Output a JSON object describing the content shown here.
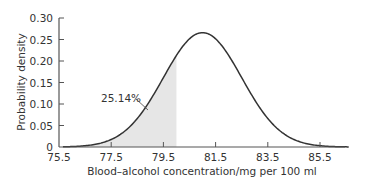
{
  "chart_data": {
    "type": "area",
    "title": "",
    "xlabel": "Blood–alcohol concentration/mg per 100 ml",
    "ylabel": "Probability density",
    "xlim": [
      75.5,
      87.0
    ],
    "ylim": [
      0,
      0.3
    ],
    "grid": false,
    "legend": null,
    "x_ticks": [
      "75.5",
      "77.5",
      "79.5",
      "81.5",
      "83.5",
      "85.5"
    ],
    "y_ticks": [
      "0",
      "0.05",
      "0.10",
      "0.15",
      "0.20",
      "0.25",
      "0.30"
    ],
    "distribution": {
      "kind": "normal",
      "mean": 81.0,
      "sd": 1.5,
      "peak_density": 0.266
    },
    "shaded_region": {
      "from": 75.5,
      "to": 80.0,
      "area_percent": 25.14,
      "color": "#e6e6e6"
    },
    "annotations": [
      {
        "text": "25.14%",
        "points_to_x": 79.0
      }
    ],
    "curve_color": "#333333"
  }
}
